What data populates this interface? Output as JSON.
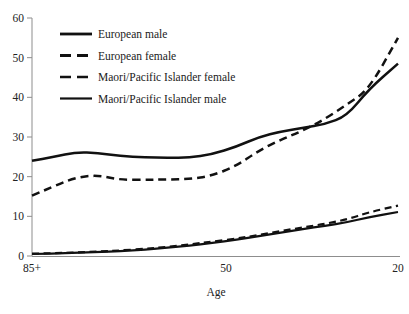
{
  "chart_data": {
    "type": "line",
    "title": "",
    "subtitle": "",
    "xlabel": "Age",
    "ylabel": "",
    "ylim": [
      0,
      60
    ],
    "yticks": [
      0,
      10,
      20,
      30,
      40,
      50,
      60
    ],
    "ytick_labels": [
      "0",
      "10",
      "20",
      "30",
      "40",
      "50",
      "60"
    ],
    "xtick_labels": [
      "85+",
      "50",
      "20"
    ],
    "xtick_positions": [
      0,
      0.53,
      1.0
    ],
    "x_note": "age decreases left to right, from 85+ through 50 to 20",
    "grid": false,
    "legend_position": "top-left-inside",
    "series": [
      {
        "name": "European male",
        "style": "solid",
        "color": "#111111",
        "x": [
          0.0,
          0.06,
          0.12,
          0.18,
          0.24,
          0.31,
          0.37,
          0.43,
          0.49,
          0.56,
          0.62,
          0.68,
          0.74,
          0.8,
          0.86,
          0.92,
          1.0
        ],
        "values": [
          24.0,
          25.0,
          26.2,
          26.0,
          25.2,
          24.9,
          24.8,
          24.8,
          25.6,
          27.6,
          30.0,
          31.4,
          32.3,
          33.2,
          35.3,
          42.0,
          48.5
        ]
      },
      {
        "name": "European female",
        "style": "dashed",
        "color": "#111111",
        "x": [
          0.0,
          0.06,
          0.12,
          0.18,
          0.24,
          0.31,
          0.37,
          0.43,
          0.49,
          0.56,
          0.62,
          0.68,
          0.74,
          0.8,
          0.86,
          0.92,
          1.0
        ],
        "values": [
          15.2,
          17.6,
          19.8,
          20.4,
          19.2,
          19.2,
          19.3,
          19.4,
          20.2,
          22.8,
          26.6,
          29.3,
          31.6,
          34.5,
          38.2,
          41.9,
          55.0
        ]
      },
      {
        "name": "Maori/Pacific Islander female",
        "style": "dashed",
        "color": "#111111",
        "x": [
          0.0,
          0.06,
          0.12,
          0.18,
          0.24,
          0.31,
          0.37,
          0.43,
          0.49,
          0.56,
          0.62,
          0.68,
          0.74,
          0.8,
          0.86,
          0.92,
          1.0
        ],
        "values": [
          0.6,
          0.7,
          0.9,
          1.1,
          1.4,
          1.8,
          2.3,
          2.9,
          3.6,
          4.4,
          5.3,
          6.3,
          7.2,
          8.1,
          9.2,
          11.0,
          12.7
        ]
      },
      {
        "name": "Maori/Pacific Islander male",
        "style": "solid",
        "color": "#111111",
        "x": [
          0.0,
          0.06,
          0.12,
          0.18,
          0.24,
          0.31,
          0.37,
          0.43,
          0.49,
          0.56,
          0.62,
          0.68,
          0.74,
          0.8,
          0.86,
          0.92,
          1.0
        ],
        "values": [
          0.5,
          0.6,
          0.8,
          1.0,
          1.2,
          1.6,
          2.1,
          2.6,
          3.3,
          4.1,
          5.0,
          5.9,
          6.8,
          7.6,
          8.5,
          9.8,
          11.1
        ]
      }
    ],
    "annotations": [
      "European male and European female curves cross near 31 at about the x=0.66 position"
    ]
  },
  "legend": {
    "items": [
      {
        "label": "European male",
        "style": "solid-thick"
      },
      {
        "label": "European female",
        "style": "dashed-thick"
      },
      {
        "label": "Maori/Pacific Islander female",
        "style": "dashed-thin"
      },
      {
        "label": "Maori/Pacific Islander male",
        "style": "solid-thin"
      }
    ]
  }
}
